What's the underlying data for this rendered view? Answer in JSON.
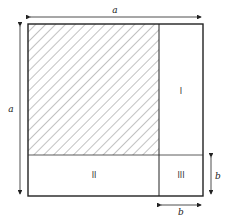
{
  "diagram": {
    "title": "",
    "dimensions": {
      "top_label": "a",
      "left_label": "a",
      "right_label": "b",
      "bottom_label": "b"
    },
    "regions": [
      {
        "id": "shaded",
        "label": "",
        "fill": "hatched"
      },
      {
        "id": "I",
        "label": "I"
      },
      {
        "id": "II",
        "label": "II"
      },
      {
        "id": "III",
        "label": "III"
      }
    ],
    "colors": {
      "stroke": "#222222",
      "hatch": "#555555",
      "background": "#ffffff"
    }
  }
}
